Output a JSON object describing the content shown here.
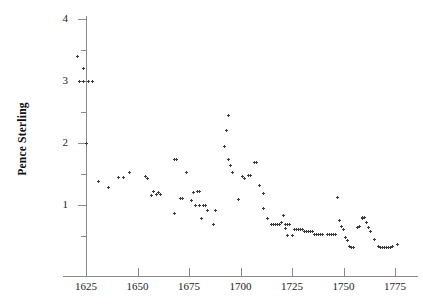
{
  "chart_data": {
    "type": "scatter",
    "title": "",
    "xlabel": "",
    "ylabel": "Pence Sterling",
    "xlim": [
      1618,
      1778
    ],
    "ylim": [
      0.2,
      4.15
    ],
    "xticks": [
      1625,
      1650,
      1675,
      1700,
      1725,
      1750,
      1775
    ],
    "xtick_labels": [
      "1625",
      "1650",
      "1675",
      "1700",
      "1725",
      "1750",
      "1775"
    ],
    "yticks": [
      1,
      2,
      3,
      4
    ],
    "ytick_labels": [
      "1",
      "2",
      "3",
      "4"
    ],
    "yticks_minor": [
      0.5,
      1.5,
      2.5,
      3.5
    ],
    "grid": false,
    "legend": null,
    "marker": "plus",
    "marker_color": "#3d3d3d",
    "points": [
      [
        1621,
        3.4
      ],
      [
        1624,
        3.2
      ],
      [
        1622,
        3.0
      ],
      [
        1624,
        3.0
      ],
      [
        1626,
        3.0
      ],
      [
        1628,
        3.0
      ],
      [
        1625,
        2.0
      ],
      [
        1631,
        1.38
      ],
      [
        1636,
        1.28
      ],
      [
        1641,
        1.45
      ],
      [
        1643,
        1.45
      ],
      [
        1646,
        1.52
      ],
      [
        1654,
        1.46
      ],
      [
        1655,
        1.42
      ],
      [
        1658,
        1.22
      ],
      [
        1657,
        1.16
      ],
      [
        1659,
        1.17
      ],
      [
        1661,
        1.17
      ],
      [
        1660,
        1.2
      ],
      [
        1668,
        1.73
      ],
      [
        1669,
        1.73
      ],
      [
        1668,
        0.87
      ],
      [
        1671,
        1.1
      ],
      [
        1672,
        1.1
      ],
      [
        1674,
        1.52
      ],
      [
        1676,
        1.08
      ],
      [
        1677,
        1.2
      ],
      [
        1679,
        1.22
      ],
      [
        1680,
        1.22
      ],
      [
        1678,
        1.0
      ],
      [
        1680,
        1.0
      ],
      [
        1682,
        1.0
      ],
      [
        1683,
        1.0
      ],
      [
        1681,
        0.79
      ],
      [
        1684,
        0.91
      ],
      [
        1688,
        0.91
      ],
      [
        1687,
        0.68
      ],
      [
        1694,
        2.45
      ],
      [
        1693,
        2.2
      ],
      [
        1692,
        1.95
      ],
      [
        1694,
        1.74
      ],
      [
        1695,
        1.63
      ],
      [
        1696,
        1.52
      ],
      [
        1699,
        1.09
      ],
      [
        1701,
        1.46
      ],
      [
        1702,
        1.42
      ],
      [
        1704,
        1.48
      ],
      [
        1705,
        1.48
      ],
      [
        1707,
        1.68
      ],
      [
        1708,
        1.68
      ],
      [
        1709,
        1.32
      ],
      [
        1711,
        1.18
      ],
      [
        1711,
        0.94
      ],
      [
        1713,
        0.78
      ],
      [
        1715,
        0.68
      ],
      [
        1716,
        0.68
      ],
      [
        1717,
        0.68
      ],
      [
        1718,
        0.68
      ],
      [
        1719,
        0.68
      ],
      [
        1720,
        0.72
      ],
      [
        1721,
        0.83
      ],
      [
        1722,
        0.68
      ],
      [
        1722,
        0.62
      ],
      [
        1723,
        0.68
      ],
      [
        1724,
        0.68
      ],
      [
        1723,
        0.51
      ],
      [
        1725,
        0.51
      ],
      [
        1726,
        0.6
      ],
      [
        1727,
        0.6
      ],
      [
        1728,
        0.6
      ],
      [
        1729,
        0.6
      ],
      [
        1730,
        0.6
      ],
      [
        1731,
        0.58
      ],
      [
        1732,
        0.58
      ],
      [
        1733,
        0.57
      ],
      [
        1734,
        0.57
      ],
      [
        1735,
        0.57
      ],
      [
        1736,
        0.52
      ],
      [
        1737,
        0.52
      ],
      [
        1738,
        0.52
      ],
      [
        1739,
        0.52
      ],
      [
        1740,
        0.52
      ],
      [
        1742,
        0.53
      ],
      [
        1743,
        0.53
      ],
      [
        1744,
        0.53
      ],
      [
        1745,
        0.53
      ],
      [
        1746,
        0.53
      ],
      [
        1747,
        1.12
      ],
      [
        1748,
        0.75
      ],
      [
        1749,
        0.65
      ],
      [
        1750,
        0.6
      ],
      [
        1751,
        0.48
      ],
      [
        1752,
        0.42
      ],
      [
        1753,
        0.33
      ],
      [
        1754,
        0.32
      ],
      [
        1755,
        0.32
      ],
      [
        1757,
        0.64
      ],
      [
        1758,
        0.66
      ],
      [
        1759,
        0.78
      ],
      [
        1760,
        0.8
      ],
      [
        1759,
        0.8
      ],
      [
        1761,
        0.72
      ],
      [
        1762,
        0.63
      ],
      [
        1763,
        0.58
      ],
      [
        1765,
        0.45
      ],
      [
        1767,
        0.33
      ],
      [
        1768,
        0.31
      ],
      [
        1769,
        0.31
      ],
      [
        1770,
        0.31
      ],
      [
        1771,
        0.31
      ],
      [
        1772,
        0.32
      ],
      [
        1773,
        0.32
      ],
      [
        1774,
        0.33
      ],
      [
        1776,
        0.37
      ]
    ]
  }
}
